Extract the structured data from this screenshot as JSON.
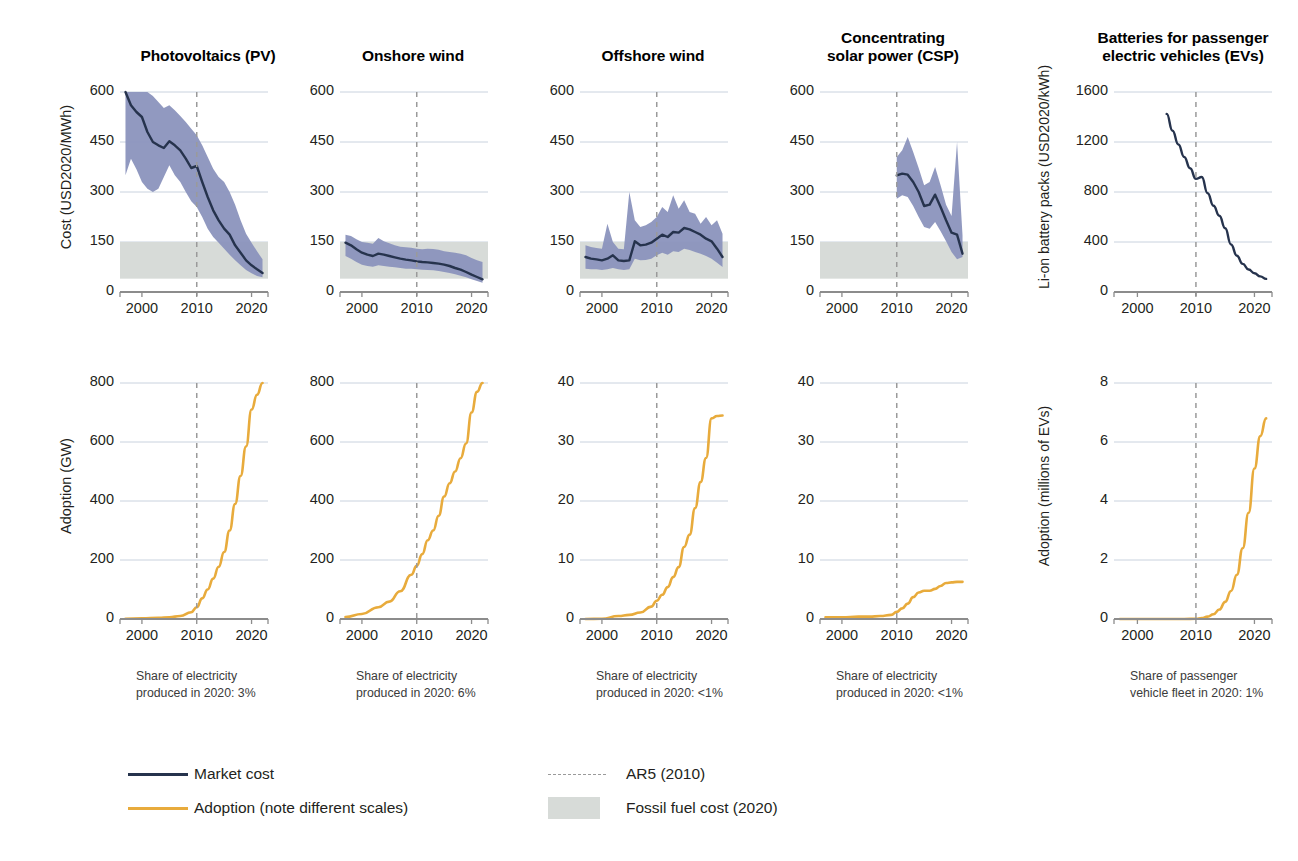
{
  "figure": {
    "colors": {
      "market_cost_line": "#26334d",
      "uncertainty_band": "#8b93bd",
      "adoption_line": "#e8ab3c",
      "fossil_fuel_band": "#d7dbd8",
      "ar5_dashed": "#9a9a9a",
      "gridline": "#c9d2de",
      "axis": "#8c8c8c",
      "background": "#ffffff"
    },
    "ar5_year": 2010
  },
  "legend": {
    "items": [
      {
        "key": "market-cost",
        "label": "Market cost",
        "type": "line",
        "color": "#26334d"
      },
      {
        "key": "adoption",
        "label": "Adoption (note different scales)",
        "type": "line",
        "color": "#e8ab3c"
      },
      {
        "key": "ar5",
        "label": "AR5 (2010)",
        "type": "dashed",
        "color": "#9a9a9a"
      },
      {
        "key": "fossil",
        "label": "Fossil fuel cost (2020)",
        "type": "box",
        "color": "#d7dbd8"
      }
    ]
  },
  "panels": [
    {
      "id": "pv",
      "title": "Photovoltaics (PV)",
      "title_lines": [
        "Photovoltaics (PV)"
      ],
      "share_note": "Share of electricity\nproduced in 2020: 3%",
      "cost": {
        "ylabel": "Cost (USD2020/MWh)",
        "yticks": [
          0,
          150,
          300,
          450,
          600
        ],
        "ylim": [
          0,
          600
        ],
        "xticks": [
          2000,
          2010,
          2020
        ],
        "xlim": [
          1996,
          2023
        ],
        "fossil_band": [
          40,
          150
        ]
      },
      "adoption": {
        "ylabel": "Adoption (GW)",
        "yticks": [
          0,
          200,
          400,
          600,
          800
        ],
        "ylim": [
          0,
          800
        ],
        "xticks": [
          2000,
          2010,
          2020
        ],
        "xlim": [
          1996,
          2023
        ]
      }
    },
    {
      "id": "onshore-wind",
      "title": "Onshore wind",
      "title_lines": [
        "Onshore wind"
      ],
      "share_note": "Share of electricity\nproduced in 2020: 6%",
      "cost": {
        "ylabel": "",
        "yticks": [
          0,
          150,
          300,
          450,
          600
        ],
        "ylim": [
          0,
          600
        ],
        "xticks": [
          2000,
          2010,
          2020
        ],
        "xlim": [
          1996,
          2023
        ],
        "fossil_band": [
          40,
          150
        ]
      },
      "adoption": {
        "ylabel": "",
        "yticks": [
          0,
          200,
          400,
          600,
          800
        ],
        "ylim": [
          0,
          800
        ],
        "xticks": [
          2000,
          2010,
          2020
        ],
        "xlim": [
          1996,
          2023
        ]
      }
    },
    {
      "id": "offshore-wind",
      "title": "Offshore wind",
      "title_lines": [
        "Offshore wind"
      ],
      "share_note": "Share of electricity\nproduced in 2020: <1%",
      "cost": {
        "ylabel": "",
        "yticks": [
          0,
          150,
          300,
          450,
          600
        ],
        "ylim": [
          0,
          600
        ],
        "xticks": [
          2000,
          2010,
          2020
        ],
        "xlim": [
          1996,
          2023
        ],
        "fossil_band": [
          40,
          150
        ]
      },
      "adoption": {
        "ylabel": "",
        "yticks": [
          0,
          10,
          20,
          30,
          40
        ],
        "ylim": [
          0,
          40
        ],
        "xticks": [
          2000,
          2010,
          2020
        ],
        "xlim": [
          1996,
          2023
        ]
      }
    },
    {
      "id": "csp",
      "title": "Concentrating solar power (CSP)",
      "title_lines": [
        "Concentrating",
        "solar power (CSP)"
      ],
      "share_note": "Share of electricity\nproduced in 2020: <1%",
      "cost": {
        "ylabel": "",
        "yticks": [
          0,
          150,
          300,
          450,
          600
        ],
        "ylim": [
          0,
          600
        ],
        "xticks": [
          2000,
          2010,
          2020
        ],
        "xlim": [
          1996,
          2023
        ],
        "fossil_band": [
          40,
          150
        ]
      },
      "adoption": {
        "ylabel": "",
        "yticks": [
          0,
          10,
          20,
          30,
          40
        ],
        "ylim": [
          0,
          40
        ],
        "xticks": [
          2000,
          2010,
          2020
        ],
        "xlim": [
          1996,
          2023
        ]
      }
    },
    {
      "id": "batteries",
      "title": "Batteries for passenger electric vehicles (EVs)",
      "title_lines": [
        "Batteries for passenger",
        "electric vehicles (EVs)"
      ],
      "share_note": "Share of passenger\nvehicle fleet in 2020: 1%",
      "cost": {
        "ylabel": "Li-on battery packs (USD2020/kWh)",
        "yticks": [
          0,
          400,
          800,
          1200,
          1600
        ],
        "ylim": [
          0,
          1600
        ],
        "xticks": [
          2000,
          2010,
          2020
        ],
        "xlim": [
          1996,
          2023
        ],
        "fossil_band": null
      },
      "adoption": {
        "ylabel": "Adoption (millions of EVs)",
        "yticks": [
          0,
          2,
          4,
          6,
          8
        ],
        "ylim": [
          0,
          8
        ],
        "xticks": [
          2000,
          2010,
          2020
        ],
        "xlim": [
          1996,
          2023
        ]
      }
    }
  ],
  "chart_data": {
    "type": "line",
    "xlabel": "Year",
    "grid": true,
    "legend_position": "bottom-left",
    "panels": [
      {
        "name": "Photovoltaics (PV)",
        "cost": {
          "ylabel": "Cost (USD2020/MWh)",
          "ylim": [
            0,
            600
          ],
          "xlim": [
            1996,
            2023
          ],
          "fossil_fuel_cost_2020": [
            40,
            150
          ],
          "x": [
            1997,
            1998,
            1999,
            2000,
            2001,
            2002,
            2003,
            2004,
            2005,
            2006,
            2007,
            2008,
            2009,
            2010,
            2011,
            2012,
            2013,
            2014,
            2015,
            2016,
            2017,
            2018,
            2019,
            2020,
            2021,
            2022
          ],
          "market": [
            600,
            560,
            540,
            525,
            480,
            450,
            440,
            432,
            452,
            440,
            425,
            400,
            372,
            378,
            330,
            285,
            245,
            215,
            190,
            172,
            140,
            118,
            95,
            80,
            68,
            57
          ],
          "band_low": [
            350,
            400,
            368,
            330,
            310,
            300,
            310,
            345,
            380,
            350,
            330,
            300,
            272,
            255,
            225,
            190,
            165,
            148,
            130,
            112,
            95,
            80,
            66,
            56,
            48,
            44
          ],
          "band_high": [
            600,
            600,
            600,
            600,
            600,
            588,
            570,
            552,
            560,
            545,
            528,
            510,
            490,
            470,
            440,
            405,
            370,
            345,
            330,
            300,
            262,
            215,
            175,
            148,
            122,
            98
          ]
        },
        "adoption": {
          "ylabel": "Adoption (GW)",
          "ylim": [
            0,
            800
          ],
          "x": [
            1997,
            2000,
            2003,
            2005,
            2007,
            2009,
            2010,
            2011,
            2012,
            2013,
            2014,
            2015,
            2016,
            2017,
            2018,
            2019,
            2020,
            2021,
            2022
          ],
          "values": [
            1,
            2,
            4,
            6,
            10,
            23,
            40,
            70,
            100,
            137,
            177,
            227,
            300,
            390,
            485,
            585,
            710,
            760,
            800
          ]
        },
        "share_of_electricity_2020": "3%"
      },
      {
        "name": "Onshore wind",
        "cost": {
          "ylabel": "Cost (USD2020/MWh)",
          "ylim": [
            0,
            600
          ],
          "xlim": [
            1996,
            2023
          ],
          "fossil_fuel_cost_2020": [
            40,
            150
          ],
          "x": [
            1997,
            1998,
            1999,
            2000,
            2001,
            2002,
            2003,
            2004,
            2005,
            2006,
            2007,
            2008,
            2009,
            2010,
            2011,
            2012,
            2013,
            2014,
            2015,
            2016,
            2017,
            2018,
            2019,
            2020,
            2021,
            2022
          ],
          "market": [
            148,
            140,
            128,
            118,
            112,
            108,
            115,
            112,
            108,
            104,
            100,
            97,
            95,
            92,
            90,
            89,
            87,
            85,
            82,
            78,
            72,
            67,
            60,
            52,
            45,
            38
          ],
          "band_low": [
            108,
            100,
            90,
            82,
            78,
            76,
            80,
            78,
            76,
            74,
            72,
            70,
            70,
            68,
            67,
            66,
            65,
            63,
            60,
            57,
            53,
            49,
            44,
            38,
            33,
            28
          ],
          "band_high": [
            172,
            168,
            158,
            150,
            148,
            145,
            162,
            152,
            146,
            140,
            136,
            134,
            133,
            130,
            128,
            130,
            129,
            127,
            122,
            120,
            118,
            115,
            110,
            102,
            95,
            90
          ]
        },
        "adoption": {
          "ylabel": "Adoption (GW)",
          "ylim": [
            0,
            800
          ],
          "x": [
            1997,
            2000,
            2003,
            2005,
            2007,
            2009,
            2010,
            2011,
            2012,
            2013,
            2014,
            2015,
            2016,
            2017,
            2018,
            2019,
            2020,
            2021,
            2022
          ],
          "values": [
            7,
            17,
            40,
            59,
            94,
            150,
            180,
            220,
            267,
            300,
            350,
            415,
            460,
            500,
            545,
            595,
            700,
            770,
            800
          ]
        },
        "share_of_electricity_2020": "6%"
      },
      {
        "name": "Offshore wind",
        "cost": {
          "ylabel": "Cost (USD2020/MWh)",
          "ylim": [
            0,
            600
          ],
          "xlim": [
            1996,
            2023
          ],
          "fossil_fuel_cost_2020": [
            40,
            150
          ],
          "x": [
            1997,
            1998,
            1999,
            2000,
            2001,
            2002,
            2003,
            2004,
            2005,
            2006,
            2007,
            2008,
            2009,
            2010,
            2011,
            2012,
            2013,
            2014,
            2015,
            2016,
            2017,
            2018,
            2019,
            2020,
            2021,
            2022
          ],
          "market": [
            105,
            100,
            98,
            95,
            100,
            110,
            95,
            93,
            95,
            152,
            140,
            142,
            148,
            160,
            172,
            165,
            180,
            178,
            192,
            188,
            180,
            172,
            160,
            152,
            130,
            105
          ],
          "band_low": [
            70,
            68,
            68,
            66,
            68,
            72,
            68,
            66,
            68,
            100,
            95,
            96,
            100,
            110,
            118,
            112,
            122,
            120,
            130,
            126,
            120,
            115,
            108,
            100,
            88,
            75
          ],
          "band_high": [
            140,
            135,
            132,
            130,
            205,
            150,
            130,
            128,
            300,
            215,
            195,
            200,
            210,
            225,
            255,
            240,
            290,
            250,
            275,
            240,
            235,
            205,
            225,
            200,
            215,
            175
          ]
        },
        "adoption": {
          "ylabel": "Adoption (GW)",
          "ylim": [
            0,
            40
          ],
          "x": [
            1997,
            2000,
            2003,
            2005,
            2007,
            2009,
            2010,
            2011,
            2012,
            2013,
            2014,
            2015,
            2016,
            2017,
            2018,
            2019,
            2020,
            2021,
            2022
          ],
          "values": [
            0.0,
            0.03,
            0.5,
            0.7,
            1.1,
            2.1,
            3.1,
            4.1,
            5.4,
            7.1,
            8.8,
            12.2,
            14.3,
            18.8,
            23.2,
            27.3,
            34.0,
            34.4,
            34.5
          ]
        },
        "share_of_electricity_2020": "<1%"
      },
      {
        "name": "Concentrating solar power (CSP)",
        "cost": {
          "ylabel": "Cost (USD2020/MWh)",
          "ylim": [
            0,
            600
          ],
          "xlim": [
            1996,
            2023
          ],
          "fossil_fuel_cost_2020": [
            40,
            150
          ],
          "x": [
            2010,
            2011,
            2012,
            2013,
            2014,
            2015,
            2016,
            2017,
            2018,
            2019,
            2020,
            2021,
            2022
          ],
          "market": [
            350,
            355,
            352,
            330,
            300,
            258,
            262,
            292,
            255,
            215,
            178,
            172,
            115
          ],
          "band_low": [
            280,
            290,
            285,
            258,
            225,
            195,
            190,
            210,
            182,
            152,
            120,
            98,
            105
          ],
          "band_high": [
            405,
            425,
            465,
            420,
            372,
            320,
            330,
            375,
            320,
            262,
            228,
            450,
            170
          ]
        },
        "adoption": {
          "ylabel": "Adoption (GW)",
          "ylim": [
            0,
            40
          ],
          "x": [
            1997,
            2000,
            2003,
            2005,
            2007,
            2009,
            2010,
            2011,
            2012,
            2013,
            2014,
            2015,
            2016,
            2017,
            2018,
            2019,
            2020,
            2021,
            2022
          ],
          "values": [
            0.3,
            0.3,
            0.4,
            0.4,
            0.5,
            0.7,
            1.2,
            1.8,
            2.6,
            3.7,
            4.5,
            4.8,
            4.8,
            5.1,
            5.6,
            6.1,
            6.2,
            6.3,
            6.3
          ]
        },
        "share_of_electricity_2020": "<1%"
      },
      {
        "name": "Batteries for passenger electric vehicles (EVs)",
        "cost": {
          "ylabel": "Li-on battery packs (USD2020/kWh)",
          "ylim": [
            0,
            1600
          ],
          "xlim": [
            1996,
            2023
          ],
          "fossil_fuel_cost_2020": null,
          "x": [
            2005,
            2006,
            2007,
            2008,
            2009,
            2010,
            2011,
            2012,
            2013,
            2014,
            2015,
            2016,
            2017,
            2018,
            2019,
            2020,
            2021,
            2022
          ],
          "market": [
            1425,
            1290,
            1180,
            1080,
            990,
            905,
            920,
            790,
            690,
            610,
            510,
            380,
            290,
            225,
            180,
            150,
            125,
            105
          ]
        },
        "adoption": {
          "ylabel": "Adoption (millions of EVs)",
          "ylim": [
            0,
            8
          ],
          "x": [
            1997,
            2000,
            2005,
            2008,
            2010,
            2011,
            2012,
            2013,
            2014,
            2015,
            2016,
            2017,
            2018,
            2019,
            2020,
            2021,
            2022
          ],
          "values": [
            0.0,
            0.0,
            0.0,
            0.0,
            0.01,
            0.03,
            0.08,
            0.16,
            0.32,
            0.58,
            0.95,
            1.5,
            2.4,
            3.6,
            5.1,
            6.2,
            6.8
          ]
        },
        "share_of_passenger_vehicle_fleet_2020": "1%"
      }
    ]
  }
}
